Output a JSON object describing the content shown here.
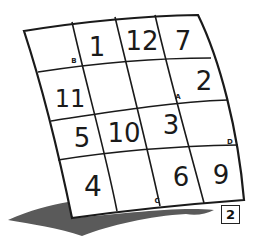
{
  "figure": {
    "grid": {
      "rows": 4,
      "cols": 4,
      "cells": [
        [
          "",
          "1",
          "12",
          "7"
        ],
        [
          "11",
          "",
          "",
          "2"
        ],
        [
          "5",
          "10",
          "3",
          ""
        ],
        [
          "4",
          "",
          "6",
          "9"
        ]
      ]
    },
    "corner_labels": [
      {
        "label": "B",
        "row": 0,
        "col": 0,
        "position": "bottom-right"
      },
      {
        "label": "A",
        "row": 1,
        "col": 2,
        "position": "bottom-right"
      },
      {
        "label": "D",
        "row": 2,
        "col": 3,
        "position": "bottom-right"
      },
      {
        "label": "C",
        "row": 3,
        "col": 1,
        "position": "bottom-right"
      }
    ],
    "figure_number": "2",
    "colors": {
      "line": "#1a1a1a",
      "shadow": "#555555",
      "background": "#ffffff"
    }
  }
}
